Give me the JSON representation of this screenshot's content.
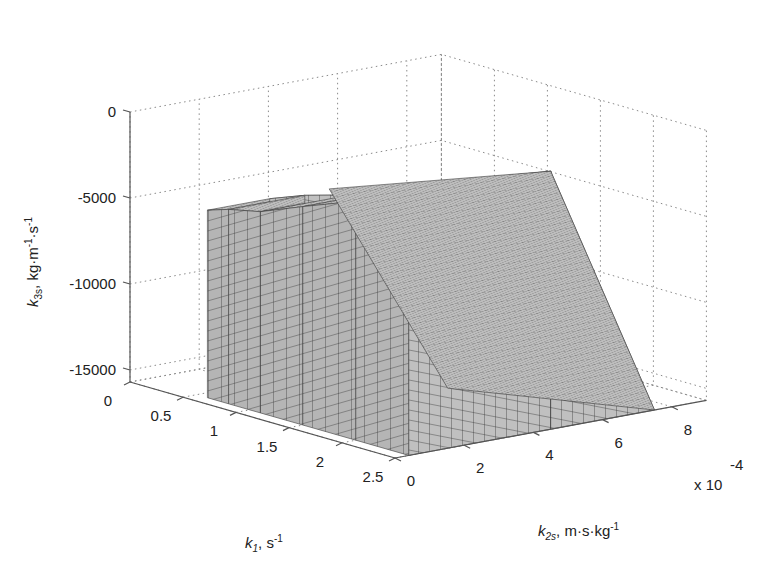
{
  "chart_data": {
    "type": "voxel3d",
    "title": "",
    "axes": {
      "x": {
        "name": "k1",
        "label_main": "k",
        "label_sub": "1",
        "label_unit": ", s",
        "label_unit_sup": "-1",
        "ticks": [
          0,
          0.5,
          1,
          1.5,
          2,
          2.5
        ],
        "tick_labels": [
          "0",
          "0.5",
          "1",
          "1.5",
          "2",
          "2.5"
        ],
        "range": [
          0,
          2.5
        ]
      },
      "y": {
        "name": "k2s",
        "label_main": "k",
        "label_sub": "2s",
        "label_unit": ", m·s·kg",
        "label_unit_sup": "-1",
        "ticks": [
          0,
          2,
          4,
          6,
          8
        ],
        "tick_labels": [
          "0",
          "2",
          "4",
          "6",
          "8"
        ],
        "multiplier_label": "x 10",
        "multiplier_exp": "-4",
        "range": [
          0,
          9
        ]
      },
      "z": {
        "name": "k3s",
        "label_main": "k",
        "label_sub": "3s",
        "label_unit": ", kg·m",
        "label_unit_sup1": "-1",
        "label_unit_mid": "·s",
        "label_unit_sup2": "-1",
        "ticks": [
          0,
          -5000,
          -10000,
          -15000
        ],
        "tick_labels": [
          "0",
          "-5000",
          "-10000",
          "-15000"
        ],
        "range": [
          -15700,
          0
        ]
      }
    },
    "grid": true,
    "box": true,
    "voxel_region": {
      "description": "Feasible parameter region rendered as stacked cubic voxels",
      "k1_range": [
        0.6,
        2.5
      ],
      "k2s_range": [
        0.5,
        7.5
      ],
      "k3s_range": [
        -15700,
        -700
      ],
      "profile_by_k1": [
        {
          "k1": 0.6,
          "k3s_bottom": -15700,
          "k3s_top": -4800,
          "k2s_min": 0.4,
          "k2s_max": 2.2
        },
        {
          "k1": 0.8,
          "k3s_bottom": -15700,
          "k3s_top": -4400,
          "k2s_min": 0.4,
          "k2s_max": 2.6
        },
        {
          "k1": 1.1,
          "k3s_bottom": -15700,
          "k3s_top": -4000,
          "k2s_min": 0.4,
          "k2s_max": 3.0
        },
        {
          "k1": 1.5,
          "k3s_bottom": -15700,
          "k3s_top": -3000,
          "k2s_min": 0.4,
          "k2s_max": 3.5
        },
        {
          "k1": 2.0,
          "k3s_bottom": -15700,
          "k3s_top": -1800,
          "k2s_min": 0.4,
          "k2s_max": 4.0
        },
        {
          "k1": 2.5,
          "k3s_bottom": -15700,
          "k3s_top": -700,
          "k2s_min": 0.4,
          "k2s_max": 4.5
        }
      ],
      "color": "#bababa",
      "edge_color": "#3a3a3a"
    },
    "colors": {
      "voxel_fill": "#bababa",
      "voxel_edge": "#3a3a3a",
      "grid": "#8a8a8a",
      "axis": "#555555",
      "text": "#222222",
      "background": "#ffffff"
    }
  }
}
